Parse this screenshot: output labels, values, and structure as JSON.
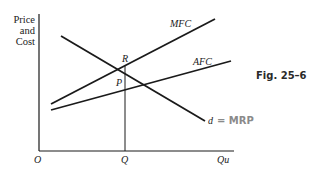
{
  "diagram": {
    "figure_label": "Fig. 25–6",
    "y_axis_label": [
      "Price",
      "and",
      "Cost"
    ],
    "x_axis_label": "Qu",
    "origin_label": "O",
    "q_label": "Q",
    "point_labels": {
      "R": "R",
      "P": "P"
    },
    "curves": [
      {
        "name": "MFC",
        "label": "MFC"
      },
      {
        "name": "AFC",
        "label": "AFC"
      },
      {
        "name": "d",
        "label": "d"
      }
    ],
    "handwritten_annotation": "= MRP",
    "colors": {
      "ink": "#1a1a1a",
      "pencil": "#8a8a8a"
    }
  }
}
